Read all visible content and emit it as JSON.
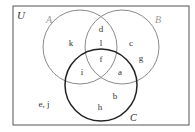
{
  "diagram": {
    "type": "venn",
    "universe_label": "U",
    "sets": [
      {
        "name": "A",
        "label": "A",
        "cx": 80,
        "cy": 47,
        "r": 37,
        "stroke": "#8a8a8a",
        "stroke_width": 1,
        "label_x": 46,
        "label_y": 23
      },
      {
        "name": "B",
        "label": "B",
        "cx": 122,
        "cy": 47,
        "r": 37,
        "stroke": "#8a8a8a",
        "stroke_width": 1,
        "label_x": 155,
        "label_y": 23
      },
      {
        "name": "C",
        "label": "C",
        "cx": 101,
        "cy": 85,
        "r": 36,
        "stroke": "#222222",
        "stroke_width": 1.5,
        "label_x": 130,
        "label_y": 121
      }
    ],
    "rect": {
      "x": 13,
      "y": 6,
      "w": 176,
      "h": 119,
      "stroke": "#555555"
    },
    "regions": [
      {
        "label": "k",
        "region": "A only",
        "x": 71,
        "y": 46
      },
      {
        "label": "d",
        "region": "A∩B only (top)",
        "x": 101,
        "y": 32
      },
      {
        "label": "l",
        "region": "A∩B only",
        "x": 101,
        "y": 46
      },
      {
        "label": "c",
        "region": "B only",
        "x": 131,
        "y": 46
      },
      {
        "label": "g",
        "region": "B only",
        "x": 141,
        "y": 61
      },
      {
        "label": "f",
        "region": "A∩B∩C",
        "x": 101,
        "y": 62
      },
      {
        "label": "i",
        "region": "A∩C only",
        "x": 82,
        "y": 75
      },
      {
        "label": "a",
        "region": "B∩C only",
        "x": 120,
        "y": 75
      },
      {
        "label": "b",
        "region": "C only",
        "x": 115,
        "y": 99
      },
      {
        "label": "h",
        "region": "C only",
        "x": 100,
        "y": 110
      },
      {
        "label": "e, j",
        "region": "outside all sets",
        "x": 44,
        "y": 107
      }
    ]
  }
}
